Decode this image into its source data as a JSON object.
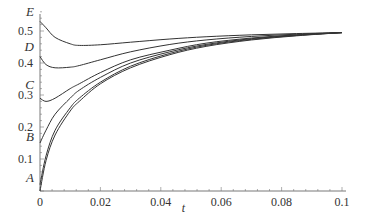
{
  "chart_data": {
    "type": "line",
    "title": "",
    "xlabel": "t",
    "ylabel": "",
    "xlim": [
      0,
      0.1
    ],
    "ylim": [
      0,
      0.58
    ],
    "grid": false,
    "legend": "none",
    "x_ticks": [
      "0",
      "0.02",
      "0.04",
      "0.06",
      "0.08",
      "0.1"
    ],
    "y_ticks": [
      "0.1",
      "0.2",
      "0.3",
      "0.4",
      "0.5"
    ],
    "x": [
      0,
      0.002,
      0.005,
      0.01,
      0.013,
      0.02,
      0.03,
      0.043,
      0.055,
      0.07,
      0.085,
      0.1
    ],
    "series": [
      {
        "name": "E",
        "values": [
          0.53,
          0.51,
          0.48,
          0.46,
          0.455,
          0.457,
          0.465,
          0.475,
          0.482,
          0.488,
          0.492,
          0.495
        ]
      },
      {
        "name": "D",
        "values": [
          0.42,
          0.395,
          0.385,
          0.387,
          0.392,
          0.41,
          0.435,
          0.458,
          0.472,
          0.483,
          0.49,
          0.495
        ]
      },
      {
        "name": "C",
        "values": [
          0.29,
          0.28,
          0.29,
          0.32,
          0.335,
          0.37,
          0.41,
          0.44,
          0.462,
          0.478,
          0.488,
          0.495
        ]
      },
      {
        "name": "B",
        "values": [
          0.15,
          0.19,
          0.24,
          0.29,
          0.315,
          0.355,
          0.4,
          0.435,
          0.458,
          0.476,
          0.487,
          0.495
        ]
      },
      {
        "name": "A",
        "values": [
          0.02,
          0.11,
          0.19,
          0.26,
          0.29,
          0.34,
          0.39,
          0.43,
          0.455,
          0.474,
          0.486,
          0.495
        ]
      },
      {
        "name": "A2",
        "values": [
          0.0,
          0.095,
          0.175,
          0.25,
          0.28,
          0.335,
          0.385,
          0.426,
          0.452,
          0.472,
          0.485,
          0.495
        ]
      }
    ],
    "curve_labels": [
      {
        "label": "E",
        "y": 0.56
      },
      {
        "label": "D",
        "y": 0.45
      },
      {
        "label": "C",
        "y": 0.33
      },
      {
        "label": "B",
        "y": 0.17
      },
      {
        "label": "A",
        "y": 0.04
      }
    ]
  }
}
